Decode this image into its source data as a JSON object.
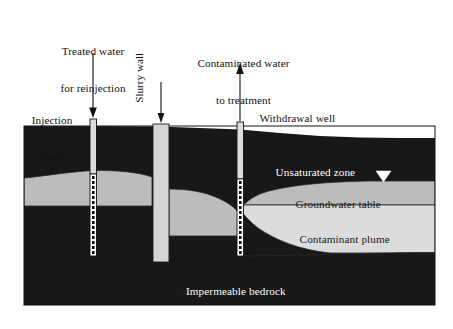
{
  "figure": {
    "background_color": "#ffffff"
  },
  "colors": {
    "bedrock": "#181818",
    "unsaturated_zone": "#181818",
    "saturated_zone": "#bcbcbc",
    "contaminant_plume": "#dcdcdc",
    "slurry_wall": "#d5d5d5",
    "well_casing": "#d9d9d9",
    "outline": "#111111",
    "label_light": "#ffffff",
    "label_dark": "#111111"
  },
  "callouts": [
    {
      "id": "treated-water",
      "line1": "Treated water",
      "line2": "for reinjection",
      "arrow": "down"
    },
    {
      "id": "slurry-wall",
      "line1": "Slurry wall",
      "line2": "",
      "arrow": "down",
      "orientation": "vertical"
    },
    {
      "id": "contaminated-water",
      "line1": "Contaminated water",
      "line2": "to treatment",
      "arrow": "up"
    }
  ],
  "well_labels": {
    "injection_line1": "Injection",
    "injection_line2": "Well",
    "withdrawal": "Withdrawal well"
  },
  "zone_labels": {
    "unsaturated": "Unsaturated zone",
    "groundwater_table": "Groundwater table",
    "contaminant_plume": "Contaminant plume",
    "bedrock": "Impermeable bedrock"
  },
  "symbols": {
    "water_table_marker": "water-table-triangle-icon"
  },
  "geometry": {
    "block_left": 24,
    "block_right": 435,
    "block_top": 126,
    "block_bottom": 305,
    "injection_well_x": 93,
    "slurry_wall_x": 160,
    "withdrawal_well_x": 240
  }
}
